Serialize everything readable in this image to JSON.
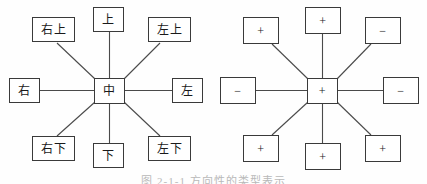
{
  "figure": {
    "background_color": "#fefefe",
    "line_color": "#3a3a3a",
    "text_color": "#1a1a1a",
    "caption": "图 2-1-1  方向性的类型表示"
  },
  "diagrams": [
    {
      "id": "directions",
      "center": {
        "label": "中"
      },
      "nodes": {
        "top_left": "右上",
        "top_center": "上",
        "top_right": "左上",
        "middle_left": "右",
        "middle_right": "左",
        "bottom_left": "右下",
        "bottom_center": "下",
        "bottom_right": "左下"
      }
    },
    {
      "id": "signs",
      "center": {
        "label": "+"
      },
      "nodes": {
        "top_left": "+",
        "top_center": "+",
        "top_right": "−",
        "middle_left": "−",
        "middle_right": "−",
        "bottom_left": "+",
        "bottom_center": "+",
        "bottom_right": "+"
      }
    }
  ]
}
